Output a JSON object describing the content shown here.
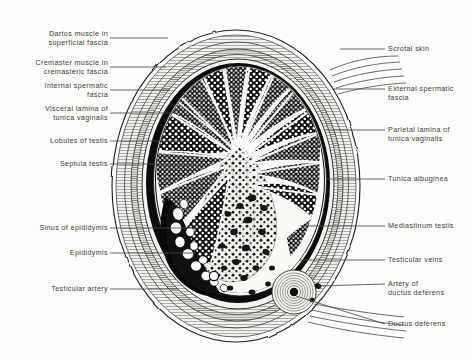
{
  "figure": {
    "type": "anatomical-cross-section",
    "background_color": "#fdfdfc",
    "ink_color": "#1a1a1a",
    "text_color": "#3b3b3b"
  },
  "labels_left": [
    {
      "id": "dartos-muscle",
      "text": "Dartos muscle in\nsuperficial fascia",
      "x": 108,
      "y": 30,
      "leader_y": 38,
      "leader_x1": 110,
      "leader_x2": 168
    },
    {
      "id": "cremaster-muscle",
      "text": "Cremaster muscle in\ncremasteric fascia",
      "x": 108,
      "y": 59,
      "leader_y": 67,
      "leader_x1": 110,
      "leader_x2": 166
    },
    {
      "id": "internal-spermatic-fascia",
      "text": "Internal spermatic\nfascia",
      "x": 108,
      "y": 82,
      "leader_y": 90,
      "leader_x1": 110,
      "leader_x2": 170
    },
    {
      "id": "visceral-lamina",
      "text": "Visceral lamina of\ntunica vaginalis",
      "x": 108,
      "y": 105,
      "leader_y": 113,
      "leader_x1": 110,
      "leader_x2": 176
    },
    {
      "id": "lobules-of-testis",
      "text": "Lobules of testis",
      "x": 108,
      "y": 137,
      "leader_y": 141,
      "leader_x1": 110,
      "leader_x2": 186
    },
    {
      "id": "septula-testis",
      "text": "Septula testis",
      "x": 108,
      "y": 160,
      "leader_y": 164,
      "leader_x1": 110,
      "leader_x2": 196
    },
    {
      "id": "sinus-of-epididymis",
      "text": "Sinus of epididymis",
      "x": 108,
      "y": 224,
      "leader_y": 228,
      "leader_x1": 110,
      "leader_x2": 214
    },
    {
      "id": "epididymis",
      "text": "Epididymis",
      "x": 108,
      "y": 249,
      "leader_y": 253,
      "leader_x1": 110,
      "leader_x2": 196
    },
    {
      "id": "testicular-artery",
      "text": "Testicular artery",
      "x": 108,
      "y": 285,
      "leader_y": 289,
      "leader_x1": 110,
      "leader_x2": 178
    }
  ],
  "labels_right": [
    {
      "id": "scrotal-skin",
      "text": "Scrotal skin",
      "x": 388,
      "y": 45,
      "leader_y": 49,
      "leader_x1": 340,
      "leader_x2": 385
    },
    {
      "id": "external-spermatic-fascia",
      "text": "External spermatic\nfascia",
      "x": 388,
      "y": 85,
      "leader_y": 89,
      "leader_x1": 335,
      "leader_x2": 385
    },
    {
      "id": "parietal-lamina",
      "text": "Parietal lamina of\ntunica vaginalis",
      "x": 388,
      "y": 126,
      "leader_y": 130,
      "leader_x1": 330,
      "leader_x2": 385
    },
    {
      "id": "tunica-albuginea",
      "text": "Tunica albuginea",
      "x": 388,
      "y": 175,
      "leader_y": 179,
      "leader_x1": 330,
      "leader_x2": 385
    },
    {
      "id": "mediastinum-testis",
      "text": "Mediastinum testis",
      "x": 388,
      "y": 222,
      "leader_y": 226,
      "leader_x1": 330,
      "leader_x2": 385
    },
    {
      "id": "testicular-veins",
      "text": "Testicular veins",
      "x": 388,
      "y": 256,
      "leader_y": 260,
      "leader_x1": 330,
      "leader_x2": 385
    },
    {
      "id": "artery-of-ductus-deferens",
      "text": "Artery of\nductus deferens",
      "x": 388,
      "y": 280,
      "leader_y": 284,
      "leader_x1": 334,
      "leader_x2": 385
    },
    {
      "id": "ductus-deferens",
      "text": "Ductus deferens",
      "x": 388,
      "y": 320,
      "leader_y": 324,
      "leader_x1": 340,
      "leader_x2": 385
    }
  ],
  "structures": [
    "scrotal skin",
    "dartos muscle in superficial fascia",
    "external spermatic fascia",
    "cremaster muscle in cremasteric fascia",
    "internal spermatic fascia",
    "parietal lamina of tunica vaginalis",
    "cavity of tunica vaginalis",
    "visceral lamina of tunica vaginalis",
    "tunica albuginea",
    "lobules of testis",
    "septula testis",
    "mediastinum testis",
    "sinus of epididymis",
    "epididymis",
    "testicular artery",
    "testicular veins",
    "ductus deferens",
    "artery of ductus deferens"
  ]
}
